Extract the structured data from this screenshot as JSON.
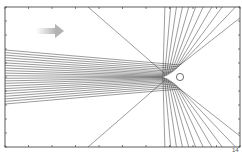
{
  "figure": {
    "type": "trajectory-diagram",
    "frame": {
      "x0": 5,
      "y0": 7,
      "x1": 240,
      "y1": 147
    },
    "incoming_arrow": {
      "x": 38,
      "y": 31,
      "length": 26,
      "color": "#bdbdbd"
    },
    "scatterer": {
      "cx": 180,
      "cy": 77,
      "r": 3.6
    },
    "apex": {
      "x": 164,
      "y": 77
    },
    "trajectory_count": 22,
    "line_color": "#222222",
    "axis_exponent_label": "14"
  }
}
